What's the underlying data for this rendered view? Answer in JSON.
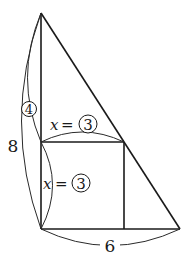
{
  "diagram": {
    "type": "geometry",
    "triangle": {
      "height_label": "8",
      "base_label": "6"
    },
    "square": {
      "side_label_top": "x",
      "side_value_top": "3",
      "side_label_left": "x",
      "side_value_left": "3"
    },
    "upper_segment": {
      "value": "4"
    },
    "equals": "="
  }
}
